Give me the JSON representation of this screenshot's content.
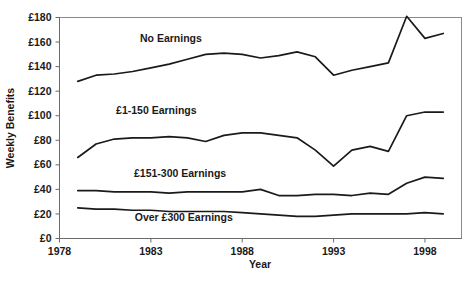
{
  "chart_data": {
    "type": "line",
    "title": "",
    "xlabel": "Year",
    "ylabel": "Weekly Benefits",
    "xlim": [
      1978,
      2000
    ],
    "ylim": [
      0,
      180
    ],
    "grid": false,
    "legend_position": "inline-labels",
    "x_ticks": [
      "1978",
      "1983",
      "1988",
      "1993",
      "1998"
    ],
    "x_tick_values": [
      1978,
      1983,
      1988,
      1993,
      1998
    ],
    "y_ticks": [
      "£0",
      "£20",
      "£40",
      "£60",
      "£80",
      "£100",
      "£120",
      "£140",
      "£160",
      "£180"
    ],
    "y_tick_values": [
      0,
      20,
      40,
      60,
      80,
      100,
      120,
      140,
      160,
      180
    ],
    "x": [
      1979,
      1980,
      1981,
      1982,
      1983,
      1984,
      1985,
      1986,
      1987,
      1988,
      1989,
      1990,
      1991,
      1992,
      1993,
      1994,
      1995,
      1996,
      1997,
      1998,
      1999
    ],
    "series": [
      {
        "name": "No Earnings",
        "label": "No Earnings",
        "label_x": 1984.1,
        "label_y": 160,
        "values": [
          128,
          133,
          134,
          136,
          139,
          142,
          146,
          150,
          151,
          150,
          147,
          149,
          152,
          148,
          133,
          137,
          140,
          143,
          145,
          150,
          152
        ]
      },
      {
        "name": "£1-150 Earnings",
        "label": "£1-150 Earnings",
        "label_x": 1983.3,
        "label_y": 101,
        "values": [
          66,
          77,
          81,
          82,
          82,
          83,
          82,
          79,
          84,
          86,
          86,
          84,
          82,
          72,
          59,
          72,
          75,
          71,
          77,
          84,
          85
        ]
      },
      {
        "name": "£151-300 Earnings",
        "label": "£151-300 Earnings",
        "label_x": 1984.6,
        "label_y": 50,
        "values": [
          39,
          39,
          38,
          38,
          38,
          37,
          38,
          38,
          38,
          38,
          40,
          35,
          35,
          36,
          36,
          35,
          37,
          36,
          38,
          38,
          38
        ]
      },
      {
        "name": "Over £300 Earnings",
        "label": "Over £300 Earnings",
        "label_x": 1984.8,
        "label_y": 14,
        "values": [
          25,
          24,
          24,
          23,
          23,
          22,
          22,
          22,
          22,
          21,
          20,
          19,
          18,
          18,
          19,
          20,
          20,
          20,
          20,
          20,
          19
        ]
      }
    ],
    "series_late": {
      "note": "tail values continue to 1999",
      "no_earnings_tail": [
        181,
        163,
        167
      ],
      "e1_150_tail": [
        100,
        103,
        103
      ],
      "e151_300_tail": [
        45,
        50,
        49
      ],
      "over_300_tail": [
        20,
        21,
        20
      ]
    }
  },
  "colors": {
    "line": "#1a1a1a",
    "frame": "#8a8a8a",
    "axis": "#6b6b6b",
    "background": "#ffffff",
    "text": "#1a1a1a"
  }
}
